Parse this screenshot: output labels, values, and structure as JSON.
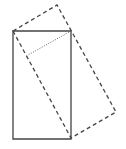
{
  "diagram": {
    "width": 126,
    "height": 149,
    "colors": {
      "stroke": "#444444",
      "background": "#ffffff"
    },
    "solid_rectangle": {
      "points": "13,31 71,31 71,139 13,139"
    },
    "dashed_rectangle": {
      "points": "13,31 57,5 116,112 71,138"
    },
    "dotted_line": {
      "x1": 71,
      "y1": 31,
      "x2": 28,
      "y2": 55
    }
  }
}
